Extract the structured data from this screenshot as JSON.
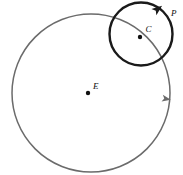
{
  "figure": {
    "name": "epicycle-diagram",
    "width": 183,
    "height": 175,
    "background": "#ffffff"
  },
  "colors": {
    "deferent_stroke": "#6b6b6b",
    "epicycle_stroke": "#1a1a1a",
    "point_fill": "#111111",
    "label_fill": "#111111"
  },
  "labels": {
    "center_deferent": "E",
    "center_epicycle": "C",
    "planet": "P"
  },
  "geometry": {
    "deferent": {
      "cx": 91,
      "cy": 93,
      "r": 79,
      "stroke_width": 1.5
    },
    "epicycle": {
      "cx": 141,
      "cy": 34,
      "r": 31.5,
      "stroke_width": 2.4
    },
    "points": [
      {
        "name": "E",
        "x": 88,
        "y": 93,
        "r": 2.2
      },
      {
        "name": "C",
        "x": 140,
        "y": 37,
        "r": 2.2
      }
    ],
    "label_positions": {
      "E": {
        "x": 93,
        "y": 89
      },
      "C": {
        "x": 145.5,
        "y": 32
      },
      "P": {
        "x": 171,
        "y": 16
      }
    },
    "arrows": {
      "epicycle_arrow": {
        "x": 158,
        "y": 9,
        "angle": 52
      },
      "deferent_arrow": {
        "x": 166.5,
        "y": 99,
        "angle": 101
      }
    }
  }
}
